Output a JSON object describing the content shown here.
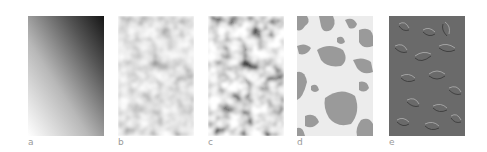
{
  "figure": {
    "panels": [
      {
        "id": "a",
        "label": "a",
        "description": "smooth grayscale gradient, dark top-right to white bottom-left"
      },
      {
        "id": "b",
        "label": "b",
        "description": "low-contrast blurred noise texture"
      },
      {
        "id": "c",
        "label": "c",
        "description": "high-contrast blurred noise texture"
      },
      {
        "id": "d",
        "label": "d",
        "description": "thresholded binary blobs, gray on light background"
      },
      {
        "id": "e",
        "label": "e",
        "description": "embossed relief of blob edges on mid-gray"
      }
    ],
    "colors": {
      "label_text": "#9a9a9a",
      "blob_gray": "#9a9a9a",
      "blob_background": "#ececec",
      "emboss_gray": "#6a6a6a"
    }
  }
}
